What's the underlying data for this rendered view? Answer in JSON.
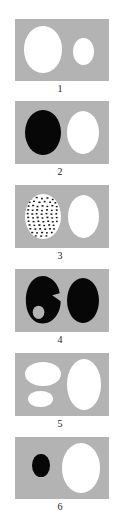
{
  "figure": {
    "type": "multi-panel-diagram",
    "panel_count": 6,
    "panel_background_color": "#b3b3b3",
    "page_background_color": "#ffffff",
    "shape_fill_white": "#ffffff",
    "shape_fill_black": "#070707",
    "label_color": "#1a1a1a",
    "panels": [
      {
        "label": "1",
        "shapes": [
          {
            "name": "large-white-ellipse-left",
            "fill": "white",
            "cx_pct": 30,
            "cy_pct": 49,
            "w_pct": 40,
            "h_pct": 75
          },
          {
            "name": "small-white-ellipse-right",
            "fill": "white",
            "cx_pct": 73,
            "cy_pct": 52,
            "w_pct": 22,
            "h_pct": 44
          }
        ]
      },
      {
        "label": "2",
        "shapes": [
          {
            "name": "large-black-ellipse-left",
            "fill": "black",
            "cx_pct": 30,
            "cy_pct": 50,
            "w_pct": 38,
            "h_pct": 72
          },
          {
            "name": "large-white-ellipse-right",
            "fill": "white",
            "cx_pct": 72,
            "cy_pct": 50,
            "w_pct": 34,
            "h_pct": 68
          }
        ]
      },
      {
        "label": "3",
        "shapes": [
          {
            "name": "stippled-ellipse-left",
            "fill": "stipple",
            "cx_pct": 30,
            "cy_pct": 50,
            "w_pct": 38,
            "h_pct": 72
          },
          {
            "name": "large-white-ellipse-right",
            "fill": "white",
            "cx_pct": 72,
            "cy_pct": 50,
            "w_pct": 33,
            "h_pct": 68
          }
        ]
      },
      {
        "label": "4",
        "shapes": [
          {
            "name": "notched-black-blob-left",
            "fill": "blob",
            "cx_pct": 30,
            "cy_pct": 50,
            "w_pct": 40,
            "h_pct": 76
          },
          {
            "name": "large-black-ellipse-right",
            "fill": "black",
            "cx_pct": 72,
            "cy_pct": 50,
            "w_pct": 34,
            "h_pct": 72
          }
        ]
      },
      {
        "label": "5",
        "shapes": [
          {
            "name": "wide-white-ellipse-upper-left",
            "fill": "white",
            "cx_pct": 30,
            "cy_pct": 33,
            "w_pct": 38,
            "h_pct": 38
          },
          {
            "name": "small-white-ellipse-lower-left",
            "fill": "white",
            "cx_pct": 27,
            "cy_pct": 73,
            "w_pct": 26,
            "h_pct": 26
          },
          {
            "name": "large-white-ellipse-right",
            "fill": "white",
            "cx_pct": 73,
            "cy_pct": 50,
            "w_pct": 36,
            "h_pct": 80
          }
        ]
      },
      {
        "label": "6",
        "shapes": [
          {
            "name": "small-black-ellipse-left",
            "fill": "black",
            "cx_pct": 28,
            "cy_pct": 46,
            "w_pct": 19,
            "h_pct": 38
          },
          {
            "name": "large-white-ellipse-right",
            "fill": "white",
            "cx_pct": 70,
            "cy_pct": 50,
            "w_pct": 40,
            "h_pct": 80
          }
        ]
      }
    ]
  }
}
